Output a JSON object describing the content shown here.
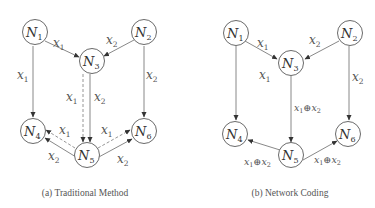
{
  "figure": {
    "panels": [
      {
        "id": "a",
        "caption": "(a) Traditional Method",
        "nodes": [
          {
            "id": "N1",
            "base": "N",
            "sub": "1"
          },
          {
            "id": "N2",
            "base": "N",
            "sub": "2"
          },
          {
            "id": "N3",
            "base": "N",
            "sub": "3"
          },
          {
            "id": "N4",
            "base": "N",
            "sub": "4"
          },
          {
            "id": "N5",
            "base": "N",
            "sub": "5"
          },
          {
            "id": "N6",
            "base": "N",
            "sub": "6"
          }
        ],
        "edges": [
          {
            "from": "N1",
            "to": "N3",
            "label": "x1",
            "style": "solid"
          },
          {
            "from": "N2",
            "to": "N3",
            "label": "x2",
            "style": "solid"
          },
          {
            "from": "N1",
            "to": "N4",
            "label": "x1",
            "style": "solid"
          },
          {
            "from": "N2",
            "to": "N6",
            "label": "x2",
            "style": "solid"
          },
          {
            "from": "N3",
            "to": "N5",
            "label": "x1",
            "style": "dashed"
          },
          {
            "from": "N3",
            "to": "N5",
            "label": "x2",
            "style": "solid"
          },
          {
            "from": "N5",
            "to": "N4",
            "label": "x1",
            "style": "dashed"
          },
          {
            "from": "N5",
            "to": "N4",
            "label": "x2",
            "style": "solid"
          },
          {
            "from": "N5",
            "to": "N6",
            "label": "x1",
            "style": "dashed"
          },
          {
            "from": "N5",
            "to": "N6",
            "label": "x2",
            "style": "solid"
          }
        ]
      },
      {
        "id": "b",
        "caption": "(b) Network Coding",
        "nodes": [
          {
            "id": "N1",
            "base": "N",
            "sub": "1"
          },
          {
            "id": "N2",
            "base": "N",
            "sub": "2"
          },
          {
            "id": "N3",
            "base": "N",
            "sub": "3"
          },
          {
            "id": "N4",
            "base": "N",
            "sub": "4"
          },
          {
            "id": "N5",
            "base": "N",
            "sub": "5"
          },
          {
            "id": "N6",
            "base": "N",
            "sub": "6"
          }
        ],
        "edges": [
          {
            "from": "N1",
            "to": "N3",
            "label": "x1",
            "style": "solid"
          },
          {
            "from": "N2",
            "to": "N3",
            "label": "x2",
            "style": "solid"
          },
          {
            "from": "N1",
            "to": "N4",
            "label": "x1",
            "style": "solid"
          },
          {
            "from": "N2",
            "to": "N6",
            "label": "x2",
            "style": "solid"
          },
          {
            "from": "N3",
            "to": "N5",
            "label": "x1⊕x2",
            "style": "solid"
          },
          {
            "from": "N5",
            "to": "N4",
            "label": "x1⊕x2",
            "style": "solid"
          },
          {
            "from": "N5",
            "to": "N6",
            "label": "x1⊕x2",
            "style": "solid"
          }
        ]
      }
    ],
    "symbols": {
      "node": "N",
      "var": "x",
      "xor": "⊕",
      "s1": "1",
      "s2": "2",
      "s3": "3",
      "s4": "4",
      "s5": "5",
      "s6": "6"
    }
  }
}
